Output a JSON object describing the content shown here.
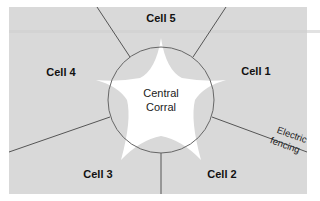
{
  "diagram": {
    "type": "paddock-layout",
    "colors": {
      "background": "#ffffff",
      "field": "#d9d9d9",
      "corral": "#ffffff",
      "fence_line": "#555555",
      "circle_line": "#666666",
      "text": "#111111"
    },
    "center": {
      "label_line1": "Central",
      "label_line2": "Corral"
    },
    "cells": [
      {
        "id": "cell-1",
        "label": "Cell 1"
      },
      {
        "id": "cell-2",
        "label": "Cell 2"
      },
      {
        "id": "cell-3",
        "label": "Cell 3"
      },
      {
        "id": "cell-4",
        "label": "Cell 4"
      },
      {
        "id": "cell-5",
        "label": "Cell 5"
      }
    ],
    "fence_annotation": {
      "line1": "Electric",
      "line2": "fencing"
    }
  }
}
